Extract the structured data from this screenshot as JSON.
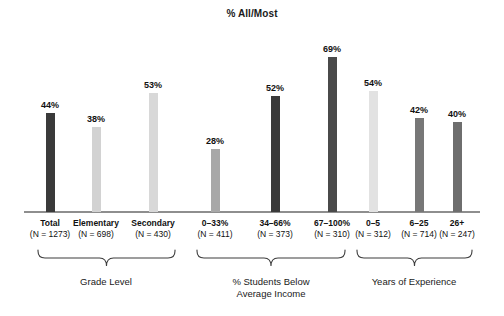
{
  "chart_data": {
    "type": "bar",
    "title": "% All/Most",
    "xlabel": "",
    "ylabel": "",
    "ylim": [
      0,
      100
    ],
    "grid": false,
    "legend": "none",
    "categories": [
      "Total",
      "Elementary",
      "Secondary",
      "0–33%",
      "34–66%",
      "67–100%",
      "0–5",
      "6–25",
      "26+"
    ],
    "values": [
      44,
      38,
      53,
      28,
      52,
      69,
      54,
      42,
      40
    ],
    "value_labels": [
      "44%",
      "38%",
      "53%",
      "28%",
      "52%",
      "69%",
      "54%",
      "42%",
      "40%"
    ],
    "sample_sizes": [
      "(N = 1273)",
      "(N = 698)",
      "(N = 430)",
      "(N = 411)",
      "(N = 373)",
      "(N = 310)",
      "(N = 312)",
      "(N = 714)",
      "(N = 247)"
    ],
    "bar_colors": [
      "#3a3a3a",
      "#d2d2d2",
      "#d8d8d8",
      "#a8a8a8",
      "#3a3a3a",
      "#4a4a4a",
      "#e2e2e2",
      "#777777",
      "#6e6e6e"
    ],
    "groups": [
      {
        "label": "Grade Level",
        "start_index": 0,
        "end_index": 2
      },
      {
        "label": "% Students Below Average Income",
        "start_index": 3,
        "end_index": 5
      },
      {
        "label": "Years of Experience",
        "start_index": 6,
        "end_index": 8
      }
    ]
  },
  "bars": [
    {
      "category": "Total",
      "value_label": "44%",
      "n": "(N = 1273)",
      "value": 44,
      "color": "#3a3a3a",
      "x": 50
    },
    {
      "category": "Elementary",
      "value_label": "38%",
      "n": "(N = 698)",
      "value": 38,
      "color": "#d2d2d2",
      "x": 96
    },
    {
      "category": "Secondary",
      "value_label": "53%",
      "n": "(N = 430)",
      "value": 53,
      "color": "#d8d8d8",
      "x": 153
    },
    {
      "category": "0–33%",
      "value_label": "28%",
      "n": "(N = 411)",
      "value": 28,
      "color": "#a8a8a8",
      "x": 215
    },
    {
      "category": "34–66%",
      "value_label": "52%",
      "n": "(N = 373)",
      "value": 52,
      "color": "#3a3a3a",
      "x": 275
    },
    {
      "category": "67–100%",
      "value_label": "69%",
      "n": "(N = 310)",
      "value": 69,
      "color": "#4a4a4a",
      "x": 332
    },
    {
      "category": "0–5",
      "value_label": "54%",
      "n": "(N = 312)",
      "value": 54,
      "color": "#e2e2e2",
      "x": 373
    },
    {
      "category": "6–25",
      "value_label": "42%",
      "n": "(N = 714)",
      "value": 42,
      "color": "#777777",
      "x": 419
    },
    {
      "category": "26+",
      "value_label": "40%",
      "n": "(N = 247)",
      "value": 40,
      "color": "#6e6e6e",
      "x": 457
    }
  ],
  "groups": [
    {
      "label": "Grade Level",
      "brace_left": 38,
      "brace_right": 175,
      "label_x": 106
    },
    {
      "label": "% Students Below\nAverage Income",
      "label_line1": "% Students Below",
      "label_line2": "Average Income",
      "brace_left": 197,
      "brace_right": 345,
      "label_x": 271
    },
    {
      "label": "Years of Experience",
      "brace_left": 357,
      "brace_right": 472,
      "label_x": 414
    }
  ]
}
